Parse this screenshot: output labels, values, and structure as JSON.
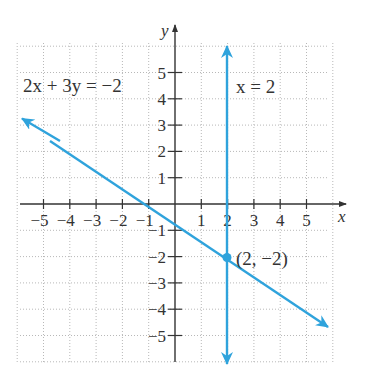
{
  "chart_data": {
    "type": "line",
    "title": "",
    "xlabel": "x",
    "ylabel": "y",
    "xlim": [
      -6,
      6
    ],
    "ylim": [
      -6,
      6
    ],
    "x_ticks": [
      -5,
      -4,
      -3,
      -2,
      -1,
      1,
      2,
      3,
      4,
      5
    ],
    "y_ticks": [
      5,
      4,
      3,
      2,
      1,
      -1,
      -2,
      -3,
      -4,
      -5
    ],
    "grid": true,
    "series": [
      {
        "name": "2x + 3y = −2",
        "equation": "2x + 3y = -2",
        "color": "#2fa3dc",
        "x": [
          -5.8,
          5.8
        ],
        "y": [
          3.2,
          -4.53
        ],
        "arrows": "both"
      },
      {
        "name": "x = 2",
        "equation": "x = 2",
        "color": "#2fa3dc",
        "x": [
          2,
          2
        ],
        "y": [
          5.9,
          -6.0
        ],
        "arrows": "both"
      }
    ],
    "points": [
      {
        "x": 2,
        "y": -2,
        "label": "(2, −2)"
      }
    ],
    "annotations": [
      "2x + 3y = −2",
      "x = 2",
      "(2, −2)"
    ]
  },
  "labels": {
    "x_axis": "x",
    "y_axis": "y",
    "line1": "2x + 3y = −2",
    "line2": "x = 2",
    "point": "(2, −2)",
    "xticks": [
      "−5",
      "−4",
      "−3",
      "−2",
      "−1",
      "1",
      "2",
      "3",
      "4",
      "5"
    ],
    "yticks": [
      "5",
      "4",
      "3",
      "2",
      "1",
      "−1",
      "−2",
      "−3",
      "−4",
      "−5"
    ]
  },
  "colors": {
    "line": "#2fa3dc",
    "axis": "#333333",
    "grid": "#b8b8b8"
  }
}
